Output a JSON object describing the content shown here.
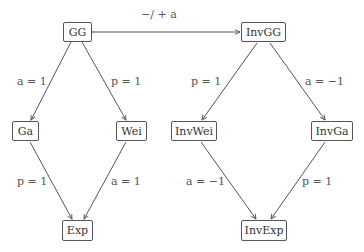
{
  "nodes": {
    "gg": "GG",
    "invgg": "InvGG",
    "ga": "Ga",
    "wei": "Wei",
    "invwei": "InvWei",
    "invga": "InvGa",
    "exp": "Exp",
    "invexp": "InvExp"
  },
  "edges": {
    "gg_invgg": "−/ + a",
    "gg_ga": "a = 1",
    "gg_wei": "p = 1",
    "ga_exp": "p = 1",
    "wei_exp": "a = 1",
    "invgg_invwei": "p = 1",
    "invgg_invga": "a = −1",
    "invwei_invexp": "a = −1",
    "invga_invexp": "p = 1"
  },
  "colors": {
    "line": "#555555",
    "text": "#333333"
  }
}
